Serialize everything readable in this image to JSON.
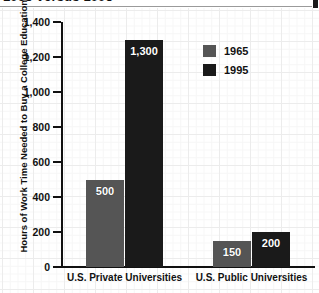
{
  "title": {
    "text": "1965 versus 1995",
    "cropped": true
  },
  "chart_data": {
    "type": "bar",
    "title": "1965 versus 1995",
    "xlabel": "",
    "ylabel": "Hours of Work Time Needed to Buy a College Education",
    "categories": [
      "U.S. Private Universities",
      "U.S. Public Universities"
    ],
    "series": [
      {
        "name": "1965",
        "color": "#555555",
        "values": [
          500,
          150
        ],
        "labels": [
          "500",
          "150"
        ]
      },
      {
        "name": "1995",
        "color": "#1a1a1a",
        "values": [
          1300,
          200
        ],
        "labels": [
          "1,300",
          "200"
        ]
      }
    ],
    "ylim": [
      0,
      1400
    ],
    "yticks": [
      0,
      200,
      400,
      600,
      800,
      1000,
      1200,
      1400
    ],
    "ytick_labels": [
      "0",
      "200",
      "400",
      "600",
      "800",
      "1,000",
      "1,200",
      "1,400"
    ],
    "grid": true,
    "legend_position": "upper right"
  },
  "legend": {
    "entries": [
      {
        "label": "1965",
        "color": "#555555"
      },
      {
        "label": "1995",
        "color": "#1a1a1a"
      }
    ]
  },
  "colors": {
    "series_1965": "#555555",
    "series_1995": "#1a1a1a",
    "axis": "#111111",
    "grid": "#ececec",
    "background": "#ffffff"
  }
}
